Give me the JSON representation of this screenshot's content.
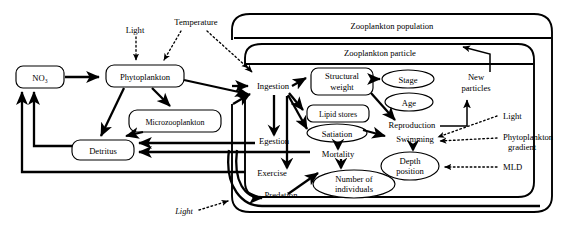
{
  "figure": {
    "kind": "conceptual-flow-diagram",
    "background": "#ffffff",
    "ink": "#000000"
  },
  "containers": [
    {
      "id": "zoo_population",
      "label": "Zooplankton population"
    },
    {
      "id": "zoo_particle",
      "label": "Zooplankton particle"
    }
  ],
  "nodes": {
    "no3": "NO₃",
    "phytoplankton": "Phytoplankton",
    "microzooplankton": "Microzooplankton",
    "detritus": "Detritus",
    "ingestion": "Ingestion",
    "egestion": "Egestion",
    "exercise": "Exercise",
    "predation": "Predation",
    "structural_weight_1": "Structural",
    "structural_weight_2": "weight",
    "lipid_stores": "Lipid stores",
    "satiation": "Satiation",
    "mortality": "Mortality",
    "number_individuals_1": "Number of",
    "number_individuals_2": "individuals",
    "stage": "Stage",
    "age": "Age",
    "reproduction": "Reproduction",
    "swimming": "Swimming",
    "depth_position_1": "Depth",
    "depth_position_2": "position",
    "new_particles_1": "New",
    "new_particles_2": "particles"
  },
  "forcings": {
    "light_top": "Light",
    "temperature": "Temperature",
    "light_bottom": "Light",
    "light_right": "Light",
    "phyto_gradient_1": "Phytoplankton",
    "phyto_gradient_2": "gradient",
    "mld": "MLD"
  }
}
